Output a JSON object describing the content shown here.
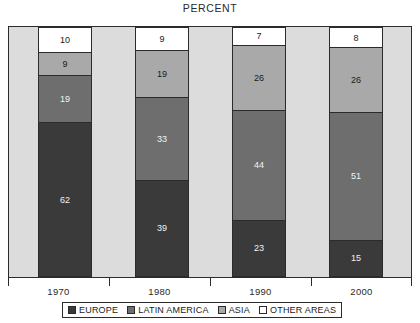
{
  "chart_data": {
    "type": "bar",
    "subtype": "stacked-percent",
    "title": "PERCENT",
    "xlabel": "",
    "ylabel": "",
    "ylim": [
      0,
      100
    ],
    "grid": false,
    "legend_position": "bottom",
    "categories": [
      "1970",
      "1980",
      "1990",
      "2000"
    ],
    "series": [
      {
        "name": "EUROPE",
        "color": "#3a3a3a",
        "values": [
          62,
          39,
          23,
          15
        ]
      },
      {
        "name": "LATIN AMERICA",
        "color": "#6e6e6e",
        "values": [
          19,
          33,
          44,
          51
        ]
      },
      {
        "name": "ASIA",
        "color": "#a9a9a9",
        "values": [
          9,
          19,
          26,
          26
        ]
      },
      {
        "name": "OTHER AREAS",
        "color": "#ffffff",
        "values": [
          10,
          9,
          7,
          8
        ]
      }
    ],
    "stack_order_top_to_bottom": [
      "OTHER AREAS",
      "ASIA",
      "LATIN AMERICA",
      "EUROPE"
    ],
    "bars": [
      {
        "category": "1970",
        "segments": [
          {
            "name": "OTHER AREAS",
            "value": "10"
          },
          {
            "name": "ASIA",
            "value": "9"
          },
          {
            "name": "LATIN AMERICA",
            "value": "19"
          },
          {
            "name": "EUROPE",
            "value": "62"
          }
        ]
      },
      {
        "category": "1980",
        "segments": [
          {
            "name": "OTHER AREAS",
            "value": "9"
          },
          {
            "name": "ASIA",
            "value": "19"
          },
          {
            "name": "LATIN AMERICA",
            "value": "33"
          },
          {
            "name": "EUROPE",
            "value": "39"
          }
        ]
      },
      {
        "category": "1990",
        "segments": [
          {
            "name": "OTHER AREAS",
            "value": "7"
          },
          {
            "name": "ASIA",
            "value": "26"
          },
          {
            "name": "LATIN AMERICA",
            "value": "44"
          },
          {
            "name": "EUROPE",
            "value": "23"
          }
        ]
      },
      {
        "category": "2000",
        "segments": [
          {
            "name": "OTHER AREAS",
            "value": "8"
          },
          {
            "name": "ASIA",
            "value": "26"
          },
          {
            "name": "LATIN AMERICA",
            "value": "51"
          },
          {
            "name": "EUROPE",
            "value": "15"
          }
        ]
      }
    ]
  },
  "legend": {
    "items": [
      {
        "label": "EUROPE",
        "color": "#3a3a3a"
      },
      {
        "label": "LATIN AMERICA",
        "color": "#6e6e6e"
      },
      {
        "label": "ASIA",
        "color": "#a9a9a9"
      },
      {
        "label": "OTHER AREAS",
        "color": "#ffffff"
      }
    ]
  },
  "axis": {
    "x_tick_labels": [
      "1970",
      "1980",
      "1990",
      "2000"
    ]
  },
  "colors": {
    "plot_background": "#dcdcdc",
    "frame": "#2b2b2b",
    "page_background": "#ffffff"
  }
}
